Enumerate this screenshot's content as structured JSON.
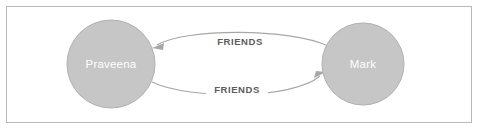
{
  "panel": {
    "title": "Graph Visualization",
    "background_color": "#ffffff",
    "border_color": "#b9b9b9"
  },
  "graph": {
    "node_fill_color": "#c6c6c6",
    "node_stroke_color": "#b0b0b0",
    "node_label_color": "#ffffff",
    "relationship_color": "#a7a7a7",
    "relationship_label_color": "#5c5c5c",
    "nodes": [
      {
        "id": "praveena",
        "label": "Praveena",
        "cx": 111,
        "cy": 64,
        "r": 44
      },
      {
        "id": "mark",
        "label": "Mark",
        "cx": 363,
        "cy": 64,
        "r": 41
      }
    ],
    "relationships": [
      {
        "id": "rel-top",
        "type": "FRIENDS",
        "source": "mark",
        "target": "praveena",
        "direction": "left",
        "label_x": 240,
        "label_y": 42
      },
      {
        "id": "rel-bottom",
        "type": "FRIENDS",
        "source": "praveena",
        "target": "mark",
        "direction": "right",
        "label_x": 237,
        "label_y": 90
      }
    ]
  }
}
